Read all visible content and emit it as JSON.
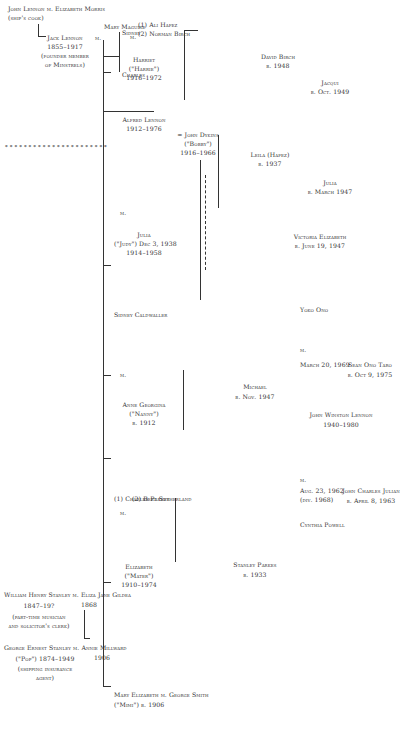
{
  "decoration": {
    "dotted_rule": "••••••••••••••••••••••"
  },
  "lennon": {
    "john": {
      "name": "John Lennon",
      "marr": "m.",
      "spouse": "Elizabeth Morris",
      "note": "(ship's cook)"
    },
    "jack": {
      "name": "Jack Lennon",
      "dates": "1855–1917",
      "note1": "(founder member",
      "note2": "of Minstrels)",
      "marr": "m.",
      "spouse": "Mary Maguire"
    },
    "jack_children": {
      "charles": "Charles",
      "sidney": "Sidney"
    },
    "alfred": {
      "name": "Alfred Lennon",
      "dates": "1912–1976"
    }
  },
  "stanley": {
    "william": {
      "name": "William Henry Stanley",
      "marr": "m.",
      "spouse": "Eliza Jane Gildea",
      "dates": "1847–19?",
      "year": "1868",
      "note1": "(part-time musician",
      "note2": "and solicitor's clerk)"
    },
    "george": {
      "name": "George Ernest Stanley",
      "marr": "m.",
      "spouse": "Annie Millward",
      "dates": "(\"Pop\") 1874–1949",
      "year": "1906",
      "note1": "(shipping insurance",
      "note2": "agent)"
    }
  },
  "children": {
    "mary": {
      "name": "Mary Elizabeth",
      "marr": "m.",
      "spouse": "George Smith",
      "detail": "(\"Mimi\") b. 1906"
    },
    "elizabeth": {
      "name": "Elizabeth",
      "nick": "(\"Mater\")",
      "dates": "1910–1974",
      "marr": "m.",
      "spouse1": "(1) Charles Parkes",
      "spouse2": "(2) Bert Sutherland"
    },
    "anne": {
      "name": "Anne Georgina",
      "nick": "(\"Nanny\")",
      "dates": "b. 1912",
      "marr": "m.",
      "spouse": "Sidney Caldwaller"
    },
    "julia": {
      "name": "Julia",
      "nick": "(\"Judy\") Dec 3, 1938",
      "dates": "1914–1958",
      "marr": "m."
    },
    "dykins": {
      "name": "= John Dykins",
      "nick": "(\"Bobby\")",
      "dates": "1916–1966"
    },
    "harriet": {
      "name": "Harriet",
      "nick": "(\"Harrie\")",
      "dates": "1916–1972",
      "marr": "m.",
      "spouse1": "(1) Ali Hafez",
      "spouse2": "(2) Norman Birch"
    }
  },
  "grandchildren": {
    "stanley_parkes": {
      "name": "Stanley Parkes",
      "dates": "b. 1933"
    },
    "michael": {
      "name": "Michael",
      "dates": "b. Nov. 1947"
    },
    "john_winston": {
      "name": "John Winston Lennon",
      "dates": "1940–1980",
      "marr": "m.",
      "spouse": "Yoko Ono",
      "wed": "March 20, 1969"
    },
    "cynthia": {
      "name": "Cynthia Powell",
      "marr": "m.",
      "wed": "Aug. 23, 1962",
      "div": "(div. 1968)"
    },
    "victoria": {
      "name": "Victoria Elizabeth",
      "dates": "b. June 19, 1947"
    },
    "julia_d": {
      "name": "Julia",
      "dates": "b. March 1947"
    },
    "jacqui": {
      "name": "Jacqui",
      "dates": "b. Oct. 1949"
    },
    "leila": {
      "name": "Leila (Hafez)",
      "dates": "b. 1937"
    },
    "david": {
      "name": "David Birch",
      "dates": "b. 1948"
    }
  },
  "great_grandchildren": {
    "julian": {
      "name": "John Charles Julian",
      "dates": "b. April 8, 1963"
    },
    "sean": {
      "name": "Sean Ono Taro",
      "dates": "b. Oct 9, 1975"
    }
  }
}
